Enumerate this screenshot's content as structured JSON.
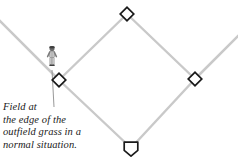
{
  "figure": {
    "type": "baseball-field-diagram",
    "background_color": "#ffffff",
    "baseline_color": "#c9c9c9",
    "foul_line_color": "#c9c9c9",
    "base_outline_color": "#1a1a1a",
    "base_fill_color": "#ffffff",
    "leader_line_color": "#8c8c8c",
    "text_color": "#1a1a1a"
  },
  "caption": {
    "lines": [
      "Field at",
      "the edge of the",
      "outfield grass in a",
      "normal situation."
    ],
    "full_text": "Field at the edge of the outfield grass in a normal situation."
  },
  "bases": [
    {
      "name": "home-plate",
      "label": "Home plate",
      "shape": "pentagon",
      "x": 131,
      "y": 148
    },
    {
      "name": "first-base",
      "label": "First base",
      "shape": "diamond",
      "x": 195,
      "y": 79
    },
    {
      "name": "second-base",
      "label": "Second base",
      "shape": "diamond",
      "x": 127,
      "y": 14
    },
    {
      "name": "third-base",
      "label": "Third base",
      "shape": "diamond",
      "x": 59,
      "y": 80
    }
  ],
  "player": {
    "name": "fielder-figure",
    "label": "Fielder",
    "x": 52,
    "y": 58
  }
}
